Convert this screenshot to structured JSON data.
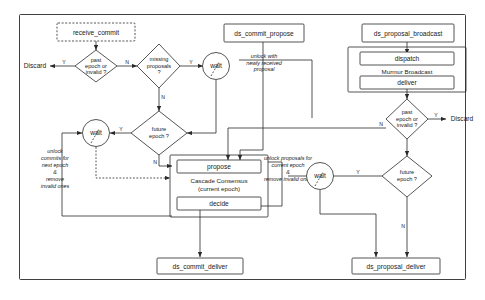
{
  "diagram": {
    "frame": {
      "name": "outer-frame"
    },
    "nodes": {
      "receive_commit": {
        "label": "receive_commit",
        "shape": "dashed-box"
      },
      "ds_commit_propose": {
        "label": "ds_commit_propose",
        "shape": "box"
      },
      "ds_proposal_broadcast": {
        "label": "ds_proposal_broadcast",
        "shape": "box"
      },
      "dispatch": {
        "label": "dispatch",
        "shape": "box"
      },
      "deliver": {
        "label": "deliver",
        "shape": "box"
      },
      "murmur_group": {
        "label": "Murmur Broadcast",
        "shape": "group"
      },
      "propose": {
        "label": "propose",
        "shape": "box"
      },
      "decide": {
        "label": "decide",
        "shape": "box"
      },
      "cascade_group_line1": {
        "label": "Cascade Consensus",
        "shape": "group"
      },
      "cascade_group_line2": {
        "label": "(current epoch)",
        "shape": "group"
      },
      "ds_commit_deliver": {
        "label": "ds_commit_deliver",
        "shape": "box"
      },
      "ds_proposal_deliver": {
        "label": "ds_proposal_deliver",
        "shape": "box"
      }
    },
    "decisions": {
      "commit_past_epoch": {
        "line1": "past",
        "line2": "epoch or",
        "line3": "invalid ?"
      },
      "missing_proposals": {
        "line1": "missing",
        "line2": "proposals",
        "line3": "?"
      },
      "commit_future_epoch": {
        "line1": "future",
        "line2": "epoch ?",
        "line3": ""
      },
      "proposal_past_epoch": {
        "line1": "past",
        "line2": "epoch or",
        "line3": "invalid ?"
      },
      "proposal_future_epoch": {
        "line1": "future",
        "line2": "epoch ?",
        "line3": ""
      }
    },
    "waits": {
      "wait_missing_proposals": {
        "label": "wait"
      },
      "wait_commit_future": {
        "label": "wait"
      },
      "wait_proposal_future": {
        "label": "wait"
      }
    },
    "terminals": {
      "discard_commit": {
        "label": "Discard"
      },
      "discard_proposal": {
        "label": "Discard"
      }
    },
    "edge_labels": {
      "commit_past_yes": "Y",
      "commit_past_no": "N",
      "missing_yes": "Y",
      "missing_no": "N",
      "commit_future_yes": "Y",
      "commit_future_no": "N",
      "proposal_past_yes": "Y",
      "proposal_past_no": "N",
      "proposal_future_yes": "Y",
      "proposal_future_no": "N"
    },
    "annotations": {
      "unlock_with_proposal": {
        "line1": "unlock with",
        "line2": "newly received",
        "line3": "proposal"
      },
      "unlock_commits_next_epoch": {
        "line1": "unlock",
        "line2": "commits for",
        "line3": "next epoch",
        "line4": "&",
        "line5": "remove",
        "line6": "invalid ones"
      },
      "unlock_proposals_current_epoch": {
        "line1": "unlock proposals for",
        "line2": "current epoch",
        "line3": "&",
        "line4": "remove invalid ones"
      }
    },
    "colors": {
      "stroke": "#2a2a2a",
      "fill": "#ffffff",
      "text": "#1a1a1a",
      "background": "#ffffff"
    }
  }
}
